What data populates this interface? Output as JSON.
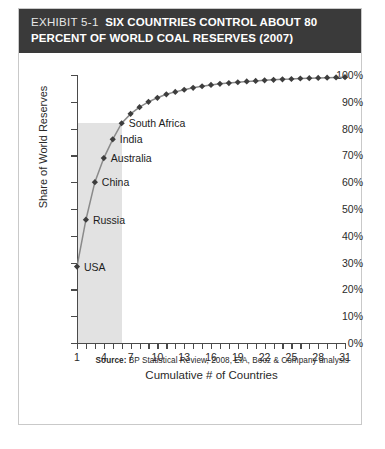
{
  "header": {
    "exhibit_number": "EXHIBIT 5-1",
    "title_line1": "SIX COUNTRIES CONTROL ABOUT 80",
    "title_line2": "PERCENT OF WORLD COAL RESERVES (2007)",
    "banner_color": "#3a3a3a"
  },
  "source": {
    "label": "Source:",
    "text": " BP Statistical Review, 2008, EIA, Booz  & Company analysis"
  },
  "chart_data": {
    "type": "line",
    "title": "SIX COUNTRIES CONTROL ABOUT 80 PERCENT OF WORLD COAL RESERVES (2007)",
    "xlabel": "Cumulative # of Countries",
    "ylabel": "Share of World Reserves",
    "xlim": [
      1,
      31
    ],
    "ylim": [
      0,
      100
    ],
    "grid": false,
    "legend": null,
    "marker": "diamond",
    "series_color": "#3d3d3d",
    "line_color": "#8a8a8a",
    "y_ticks": [
      0,
      10,
      20,
      30,
      40,
      50,
      60,
      70,
      80,
      90,
      100
    ],
    "y_tick_labels": [
      "0%",
      "10%",
      "20%",
      "30%",
      "40%",
      "50%",
      "60%",
      "70%",
      "80%",
      "90%",
      "100%"
    ],
    "x_ticks": [
      1,
      2,
      3,
      4,
      5,
      6,
      7,
      8,
      9,
      10,
      11,
      12,
      13,
      14,
      15,
      16,
      17,
      18,
      19,
      20,
      21,
      22,
      23,
      24,
      25,
      26,
      27,
      28,
      29,
      30,
      31
    ],
    "x_tick_labels": [
      {
        "value": 1,
        "label": "1"
      },
      {
        "value": 4,
        "label": "4"
      },
      {
        "value": 7,
        "label": "7"
      },
      {
        "value": 10,
        "label": "10"
      },
      {
        "value": 13,
        "label": "13"
      },
      {
        "value": 16,
        "label": "16"
      },
      {
        "value": 19,
        "label": "19"
      },
      {
        "value": 22,
        "label": "22"
      },
      {
        "value": 25,
        "label": "25"
      },
      {
        "value": 28,
        "label": "28"
      },
      {
        "value": 31,
        "label": "31"
      }
    ],
    "x": [
      1,
      2,
      3,
      4,
      5,
      6,
      7,
      8,
      9,
      10,
      11,
      12,
      13,
      14,
      15,
      16,
      17,
      18,
      19,
      20,
      21,
      22,
      23,
      24,
      25,
      26,
      27,
      28,
      29,
      30,
      31
    ],
    "values": [
      28.5,
      46,
      60,
      69,
      76,
      82,
      85.5,
      88,
      90,
      91.5,
      92.8,
      93.7,
      94.5,
      95.2,
      95.8,
      96.3,
      96.7,
      97.0,
      97.3,
      97.6,
      97.8,
      98.0,
      98.2,
      98.4,
      98.5,
      98.7,
      98.8,
      98.9,
      99.0,
      99.1,
      99.2
    ],
    "annotations": [
      {
        "label": "USA",
        "x": 1,
        "y": 28.5
      },
      {
        "label": "Russia",
        "x": 2,
        "y": 46
      },
      {
        "label": "China",
        "x": 3,
        "y": 60
      },
      {
        "label": "Australia",
        "x": 4,
        "y": 69
      },
      {
        "label": "India",
        "x": 5,
        "y": 76
      },
      {
        "label": "South Africa",
        "x": 6,
        "y": 82
      }
    ],
    "highlight_band": {
      "x_start": 1,
      "x_end": 6,
      "y_start": 0,
      "y_end": 82,
      "color": "#dddddd"
    }
  }
}
